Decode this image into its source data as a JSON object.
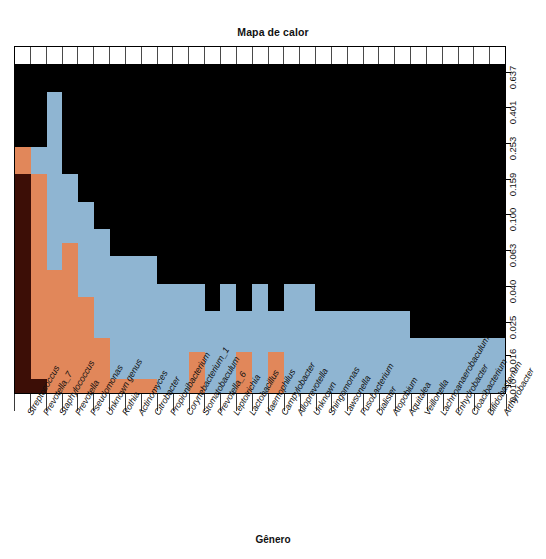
{
  "chart_data": {
    "type": "heatmap",
    "title": "Mapa de calor",
    "xlabel": "Gênero",
    "ylabel": "",
    "legend_position": "none",
    "grid": true,
    "x_tick_labels": [
      "Streptococcus",
      "Prevotella_7",
      "Staphylococcus",
      "Prevotella",
      "Pseudomonas",
      "Unknown genus",
      "Rothia",
      "Actinomyces",
      "Citrobacter",
      "Propionibacterium",
      "Corynebacterium_1",
      "Stomatobaculum",
      "Prevotella_6",
      "Leptotrichia",
      "Lactobacillus",
      "Haemophilus",
      "Campylobacter",
      "Alloprevotella",
      "Unknown",
      "Shingomonas",
      "Lawsonella",
      "Fusobacterium",
      "Dialister",
      "Atopobium",
      "Aquitalea",
      "Veillonella",
      "Lachnoanaerobaculum",
      "Enhydrobacter",
      "Cloacibacterium",
      "Bifidobacterium",
      "Arthyrobacter"
    ],
    "y_tick_labels": [
      "0.637",
      "0.401",
      "0.253",
      "0.159",
      "0.100",
      "0.063",
      "0.040",
      "0.025",
      "0.016",
      "0.010"
    ],
    "y_tick_positions_pct": [
      7.4,
      17.6,
      27.9,
      38.3,
      48.3,
      58.6,
      68.9,
      79.2,
      88.9,
      97.4
    ],
    "colors": {
      "dark_red": "#3c0e06",
      "orange": "#e1875a",
      "blue": "#8fb5d2",
      "black": "#000000",
      "frame": "#000000",
      "background": "#ffffff"
    },
    "color_levels": [
      "black",
      "blue",
      "orange",
      "dark_red"
    ],
    "n_columns": 31,
    "n_rows": 24,
    "matrix": [
      [
        "black",
        "black",
        "black",
        "black",
        "black",
        "black",
        "black",
        "black",
        "black",
        "black",
        "black",
        "black",
        "black",
        "black",
        "black",
        "black",
        "black",
        "black",
        "black",
        "black",
        "black",
        "black",
        "black",
        "black",
        "black",
        "black",
        "black",
        "black",
        "black",
        "black",
        "black"
      ],
      [
        "black",
        "black",
        "black",
        "black",
        "black",
        "black",
        "black",
        "black",
        "black",
        "black",
        "black",
        "black",
        "black",
        "black",
        "black",
        "black",
        "black",
        "black",
        "black",
        "black",
        "black",
        "black",
        "black",
        "black",
        "black",
        "black",
        "black",
        "black",
        "black",
        "black",
        "black"
      ],
      [
        "black",
        "black",
        "blue",
        "black",
        "black",
        "black",
        "black",
        "black",
        "black",
        "black",
        "black",
        "black",
        "black",
        "black",
        "black",
        "black",
        "black",
        "black",
        "black",
        "black",
        "black",
        "black",
        "black",
        "black",
        "black",
        "black",
        "black",
        "black",
        "black",
        "black",
        "black"
      ],
      [
        "black",
        "black",
        "blue",
        "black",
        "black",
        "black",
        "black",
        "black",
        "black",
        "black",
        "black",
        "black",
        "black",
        "black",
        "black",
        "black",
        "black",
        "black",
        "black",
        "black",
        "black",
        "black",
        "black",
        "black",
        "black",
        "black",
        "black",
        "black",
        "black",
        "black",
        "black"
      ],
      [
        "black",
        "black",
        "blue",
        "black",
        "black",
        "black",
        "black",
        "black",
        "black",
        "black",
        "black",
        "black",
        "black",
        "black",
        "black",
        "black",
        "black",
        "black",
        "black",
        "black",
        "black",
        "black",
        "black",
        "black",
        "black",
        "black",
        "black",
        "black",
        "black",
        "black",
        "black"
      ],
      [
        "black",
        "black",
        "blue",
        "black",
        "black",
        "black",
        "black",
        "black",
        "black",
        "black",
        "black",
        "black",
        "black",
        "black",
        "black",
        "black",
        "black",
        "black",
        "black",
        "black",
        "black",
        "black",
        "black",
        "black",
        "black",
        "black",
        "black",
        "black",
        "black",
        "black",
        "black"
      ],
      [
        "orange",
        "blue",
        "blue",
        "black",
        "black",
        "black",
        "black",
        "black",
        "black",
        "black",
        "black",
        "black",
        "black",
        "black",
        "black",
        "black",
        "black",
        "black",
        "black",
        "black",
        "black",
        "black",
        "black",
        "black",
        "black",
        "black",
        "black",
        "black",
        "black",
        "black",
        "black"
      ],
      [
        "orange",
        "blue",
        "blue",
        "black",
        "black",
        "black",
        "black",
        "black",
        "black",
        "black",
        "black",
        "black",
        "black",
        "black",
        "black",
        "black",
        "black",
        "black",
        "black",
        "black",
        "black",
        "black",
        "black",
        "black",
        "black",
        "black",
        "black",
        "black",
        "black",
        "black",
        "black"
      ],
      [
        "dark_red",
        "orange",
        "blue",
        "blue",
        "black",
        "black",
        "black",
        "black",
        "black",
        "black",
        "black",
        "black",
        "black",
        "black",
        "black",
        "black",
        "black",
        "black",
        "black",
        "black",
        "black",
        "black",
        "black",
        "black",
        "black",
        "black",
        "black",
        "black",
        "black",
        "black",
        "black"
      ],
      [
        "dark_red",
        "orange",
        "blue",
        "blue",
        "black",
        "black",
        "black",
        "black",
        "black",
        "black",
        "black",
        "black",
        "black",
        "black",
        "black",
        "black",
        "black",
        "black",
        "black",
        "black",
        "black",
        "black",
        "black",
        "black",
        "black",
        "black",
        "black",
        "black",
        "black",
        "black",
        "black"
      ],
      [
        "dark_red",
        "orange",
        "blue",
        "blue",
        "blue",
        "black",
        "black",
        "black",
        "black",
        "black",
        "black",
        "black",
        "black",
        "black",
        "black",
        "black",
        "black",
        "black",
        "black",
        "black",
        "black",
        "black",
        "black",
        "black",
        "black",
        "black",
        "black",
        "black",
        "black",
        "black",
        "black"
      ],
      [
        "dark_red",
        "orange",
        "blue",
        "blue",
        "blue",
        "black",
        "black",
        "black",
        "black",
        "black",
        "black",
        "black",
        "black",
        "black",
        "black",
        "black",
        "black",
        "black",
        "black",
        "black",
        "black",
        "black",
        "black",
        "black",
        "black",
        "black",
        "black",
        "black",
        "black",
        "black",
        "black"
      ],
      [
        "dark_red",
        "orange",
        "blue",
        "blue",
        "blue",
        "blue",
        "black",
        "black",
        "black",
        "black",
        "black",
        "black",
        "black",
        "black",
        "black",
        "black",
        "black",
        "black",
        "black",
        "black",
        "black",
        "black",
        "black",
        "black",
        "black",
        "black",
        "black",
        "black",
        "black",
        "black",
        "black"
      ],
      [
        "dark_red",
        "orange",
        "blue",
        "orange",
        "blue",
        "blue",
        "black",
        "black",
        "black",
        "black",
        "black",
        "black",
        "black",
        "black",
        "black",
        "black",
        "black",
        "black",
        "black",
        "black",
        "black",
        "black",
        "black",
        "black",
        "black",
        "black",
        "black",
        "black",
        "black",
        "black",
        "black"
      ],
      [
        "dark_red",
        "orange",
        "blue",
        "orange",
        "blue",
        "blue",
        "blue",
        "blue",
        "blue",
        "black",
        "black",
        "black",
        "black",
        "black",
        "black",
        "black",
        "black",
        "black",
        "black",
        "black",
        "black",
        "black",
        "black",
        "black",
        "black",
        "black",
        "black",
        "black",
        "black",
        "black",
        "black"
      ],
      [
        "dark_red",
        "orange",
        "orange",
        "orange",
        "blue",
        "blue",
        "blue",
        "blue",
        "blue",
        "black",
        "black",
        "black",
        "black",
        "black",
        "black",
        "black",
        "black",
        "black",
        "black",
        "black",
        "black",
        "black",
        "black",
        "black",
        "black",
        "black",
        "black",
        "black",
        "black",
        "black",
        "black"
      ],
      [
        "dark_red",
        "orange",
        "orange",
        "orange",
        "blue",
        "blue",
        "blue",
        "blue",
        "blue",
        "blue",
        "blue",
        "blue",
        "black",
        "blue",
        "black",
        "blue",
        "black",
        "blue",
        "blue",
        "black",
        "black",
        "black",
        "black",
        "black",
        "black",
        "black",
        "black",
        "black",
        "black",
        "black",
        "black"
      ],
      [
        "dark_red",
        "orange",
        "orange",
        "orange",
        "orange",
        "blue",
        "blue",
        "blue",
        "blue",
        "blue",
        "blue",
        "blue",
        "black",
        "blue",
        "black",
        "blue",
        "black",
        "blue",
        "blue",
        "black",
        "black",
        "black",
        "black",
        "black",
        "black",
        "black",
        "black",
        "black",
        "black",
        "black",
        "black"
      ],
      [
        "dark_red",
        "orange",
        "orange",
        "orange",
        "orange",
        "blue",
        "blue",
        "blue",
        "blue",
        "blue",
        "blue",
        "blue",
        "blue",
        "blue",
        "blue",
        "blue",
        "blue",
        "blue",
        "blue",
        "blue",
        "blue",
        "blue",
        "blue",
        "blue",
        "blue",
        "black",
        "black",
        "black",
        "black",
        "black",
        "black"
      ],
      [
        "dark_red",
        "orange",
        "orange",
        "orange",
        "orange",
        "blue",
        "blue",
        "blue",
        "blue",
        "blue",
        "blue",
        "blue",
        "blue",
        "blue",
        "blue",
        "blue",
        "blue",
        "blue",
        "blue",
        "blue",
        "blue",
        "blue",
        "blue",
        "blue",
        "blue",
        "black",
        "black",
        "black",
        "black",
        "black",
        "black"
      ],
      [
        "dark_red",
        "orange",
        "orange",
        "orange",
        "orange",
        "orange",
        "blue",
        "blue",
        "blue",
        "blue",
        "blue",
        "blue",
        "blue",
        "blue",
        "blue",
        "blue",
        "blue",
        "blue",
        "blue",
        "blue",
        "blue",
        "blue",
        "blue",
        "blue",
        "blue",
        "blue",
        "blue",
        "blue",
        "blue",
        "blue",
        "blue"
      ],
      [
        "dark_red",
        "orange",
        "orange",
        "orange",
        "orange",
        "orange",
        "blue",
        "blue",
        "blue",
        "blue",
        "blue",
        "orange",
        "blue",
        "blue",
        "orange",
        "blue",
        "orange",
        "blue",
        "blue",
        "blue",
        "blue",
        "blue",
        "blue",
        "blue",
        "blue",
        "blue",
        "blue",
        "blue",
        "blue",
        "blue",
        "blue"
      ],
      [
        "dark_red",
        "orange",
        "orange",
        "orange",
        "orange",
        "orange",
        "blue",
        "blue",
        "blue",
        "blue",
        "blue",
        "orange",
        "blue",
        "blue",
        "orange",
        "blue",
        "orange",
        "blue",
        "blue",
        "blue",
        "blue",
        "blue",
        "blue",
        "blue",
        "blue",
        "blue",
        "blue",
        "blue",
        "blue",
        "blue",
        "blue"
      ],
      [
        "dark_red",
        "dark_red",
        "orange",
        "orange",
        "orange",
        "orange",
        "orange",
        "orange",
        "orange",
        "blue",
        "blue",
        "orange",
        "blue",
        "blue",
        "orange",
        "blue",
        "orange",
        "blue",
        "blue",
        "blue",
        "blue",
        "blue",
        "blue",
        "blue",
        "blue",
        "blue",
        "blue",
        "blue",
        "blue",
        "blue",
        "blue"
      ]
    ]
  }
}
